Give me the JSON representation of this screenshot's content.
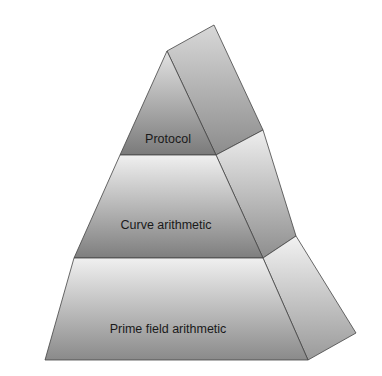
{
  "diagram": {
    "type": "pyramid",
    "layers": [
      {
        "label": "Protocol",
        "level": "top"
      },
      {
        "label": "Curve arithmetic",
        "level": "middle"
      },
      {
        "label": "Prime field arithmetic",
        "level": "bottom"
      }
    ]
  }
}
